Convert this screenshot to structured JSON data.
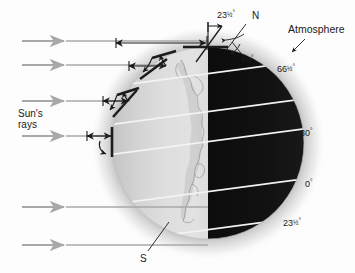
{
  "figure": {
    "type": "earth-insolation-diagram"
  },
  "labels": {
    "sun_rays_line1": "Sun's",
    "sun_rays_line2": "rays",
    "atmosphere": "Atmosphere",
    "north_pole": "N",
    "south_pole": "S",
    "axis_tilt_value": "23",
    "axis_tilt_frac": "1/2",
    "axis_tilt_deg": "°",
    "axis_tilt_full": "23½°",
    "right_angle_full": "90°",
    "right_angle_value": "90",
    "right_angle_deg": "°"
  },
  "latitudes": [
    {
      "id": "lat-66-5-n",
      "text_value": "66",
      "text_frac": "1/2",
      "text_deg": "°",
      "full": "66½°",
      "degrees": 66.5,
      "y": 70
    },
    {
      "id": "lat-30-n",
      "text_value": "30",
      "text_frac": "",
      "text_deg": "°",
      "full": "30°",
      "degrees": 30,
      "y": 133
    },
    {
      "id": "lat-0",
      "text_value": "0",
      "text_frac": "",
      "text_deg": "°",
      "full": "0°",
      "degrees": 0,
      "y": 184
    },
    {
      "id": "lat-23-5-s",
      "text_value": "23",
      "text_frac": "1/2",
      "text_deg": "°",
      "full": "23½°",
      "degrees": -23.5,
      "y": 222
    }
  ],
  "sun_rays": [
    {
      "id": "ray-1",
      "y": 41
    },
    {
      "id": "ray-2",
      "y": 65
    },
    {
      "id": "ray-3",
      "y": 101
    },
    {
      "id": "ray-4",
      "y": 136
    },
    {
      "id": "ray-5",
      "y": 207
    },
    {
      "id": "ray-6",
      "y": 245
    }
  ],
  "path_measures": [
    {
      "id": "path-polar",
      "y": 43,
      "x1": 115,
      "x2": 208,
      "note": "longest atmospheric path at high latitude"
    },
    {
      "id": "path-high-lat",
      "y": 66,
      "x1": 128,
      "x2": 168,
      "note": "long atmospheric path"
    },
    {
      "id": "path-mid-lat",
      "y": 102,
      "x1": 102,
      "x2": 129,
      "note": "medium atmospheric path"
    },
    {
      "id": "path-equator",
      "y": 137,
      "x1": 86,
      "x2": 112,
      "note": "shortest atmospheric path near equator"
    }
  ],
  "colors": {
    "background": "#fdfdfd",
    "day_side": "#d9d9d9",
    "night_side": "#111111",
    "atmosphere_halo": "#b4b4b4",
    "ray_arrow": "#a8a8a8",
    "latitude_line": "#f2f2f2",
    "annotation_black": "#1b1b1b",
    "land_outline": "#9a9a9a"
  },
  "geometry": {
    "globe_center_x": 208,
    "globe_center_y": 143,
    "globe_radius": 96,
    "atmosphere_radius": 118,
    "terminator_x": 208
  }
}
